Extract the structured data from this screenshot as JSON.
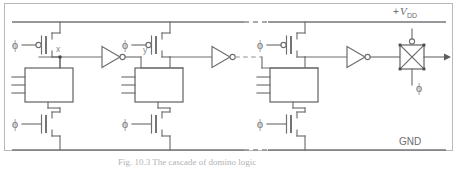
{
  "figure": {
    "rails": {
      "vdd_prefix": "+",
      "vdd_symbol": "V",
      "vdd_subscript": "DD",
      "gnd_label": "GND"
    },
    "node_labels": {
      "x": "x",
      "y": "y"
    },
    "clock_label": "ϕ",
    "clock_labels": {
      "precharge_stage1": "ϕ",
      "precharge_stage2": "ϕ",
      "precharge_stage3": "ϕ",
      "evaluate_stage1": "ϕ",
      "evaluate_stage2": "ϕ",
      "evaluate_stage3": "ϕ",
      "transmission_gate": "ϕ"
    },
    "stages": [
      {
        "name": "stage-1",
        "logic_block_inputs": 3,
        "precharge_device": "pmos",
        "evaluate_device": "nmos",
        "output_inverter": true,
        "output_node": "x"
      },
      {
        "name": "stage-2",
        "logic_block_inputs": 3,
        "precharge_device": "pmos",
        "evaluate_device": "nmos",
        "output_inverter": true,
        "output_node": "y"
      },
      {
        "name": "stage-3",
        "logic_block_inputs": 3,
        "precharge_device": "pmos",
        "evaluate_device": "nmos",
        "output_inverter": true,
        "output_node": ""
      }
    ],
    "transmission_gate": {
      "name": "transmission-gate",
      "top_gate_inverted": true,
      "bottom_gate_label": "ϕ"
    },
    "continuation": {
      "shown": true,
      "style": "dashed"
    },
    "caption": "Fig. 10.3   The cascade of domino logic"
  },
  "colors": {
    "wire": "#6e6e70",
    "rail": "#76767a",
    "dash": "#8d8d90",
    "text": "#6b6b6e",
    "frame": "#b9b9bb",
    "background": "#ffffff"
  }
}
